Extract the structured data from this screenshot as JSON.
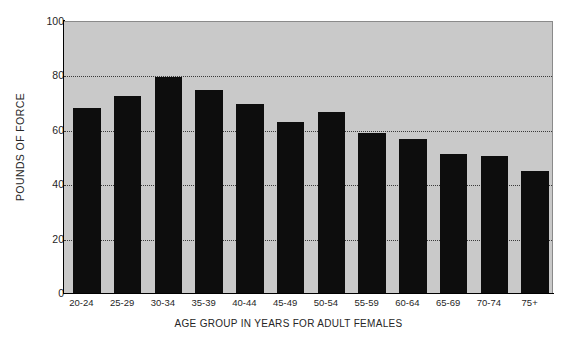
{
  "chart_data": {
    "type": "bar",
    "title": "",
    "xlabel": "AGE GROUP IN YEARS FOR ADULT FEMALES",
    "ylabel": "POUNDS OF FORCE",
    "categories": [
      "20-24",
      "25-29",
      "30-34",
      "35-39",
      "40-44",
      "45-49",
      "50-54",
      "55-59",
      "60-64",
      "65-69",
      "70-74",
      "75+"
    ],
    "values": [
      68,
      72.5,
      79.5,
      74.5,
      69.5,
      63,
      66.5,
      59,
      56.5,
      51,
      50.5,
      45
    ],
    "ylim": [
      0,
      100
    ],
    "yticks": [
      0,
      20,
      40,
      60,
      80,
      100
    ],
    "ytick_labels": [
      "0",
      "20",
      "40",
      "60",
      "80",
      "100"
    ],
    "gridlines_at": [
      20,
      40,
      60,
      80
    ],
    "grid": true,
    "legend": "none",
    "bar_color": "#0d0d0d",
    "plot_background": "#c9c9c9",
    "figure_background": "#ffffff"
  }
}
